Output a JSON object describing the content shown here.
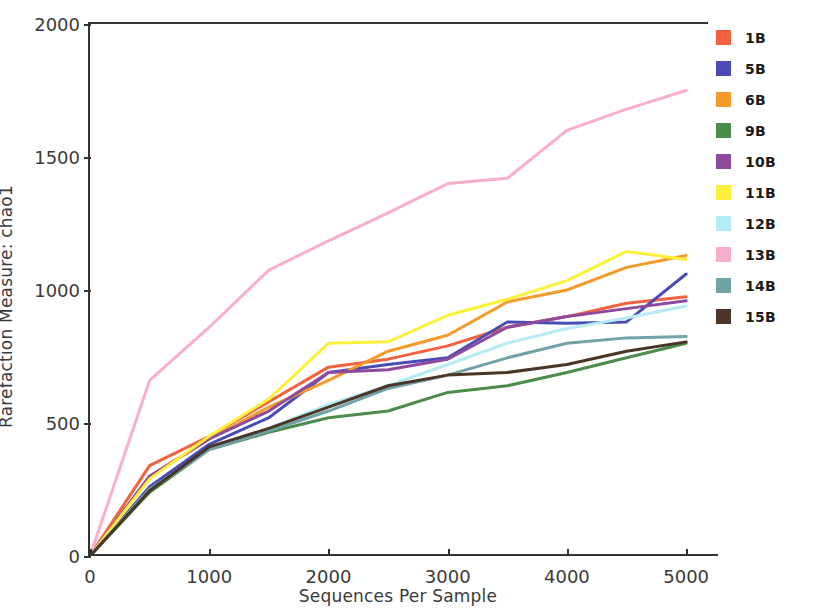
{
  "chart_data": {
    "type": "line",
    "title": "",
    "xlabel": "Sequences Per Sample",
    "ylabel": "Rarefaction Measure: chao1",
    "xlim": [
      0,
      5200
    ],
    "ylim": [
      0,
      2000
    ],
    "xticks": [
      0,
      1000,
      2000,
      3000,
      4000,
      5000
    ],
    "xtick_labels": [
      "0",
      "1000",
      "2000",
      "3000",
      "4000",
      "5000"
    ],
    "yticks": [
      0,
      500,
      1000,
      1500,
      2000
    ],
    "ytick_labels": [
      "0",
      "500",
      "1000",
      "1500",
      "2000"
    ],
    "grid": false,
    "legend_position": "right",
    "x": [
      0,
      500,
      1000,
      1500,
      2000,
      2500,
      3000,
      3500,
      4000,
      4500,
      5000
    ],
    "series": [
      {
        "name": "1B",
        "color": "#f4613e",
        "values": [
          0,
          340,
          450,
          580,
          710,
          740,
          790,
          860,
          900,
          950,
          975
        ]
      },
      {
        "name": "5B",
        "color": "#4b4bb5",
        "values": [
          0,
          260,
          420,
          520,
          690,
          720,
          745,
          880,
          875,
          880,
          1060
        ]
      },
      {
        "name": "6B",
        "color": "#f59a28",
        "values": [
          0,
          300,
          440,
          560,
          660,
          770,
          830,
          955,
          1000,
          1085,
          1130
        ]
      },
      {
        "name": "9B",
        "color": "#4a8c4a",
        "values": [
          0,
          240,
          400,
          465,
          520,
          545,
          615,
          640,
          690,
          745,
          800
        ]
      },
      {
        "name": "10B",
        "color": "#8e4b9e",
        "values": [
          0,
          300,
          440,
          545,
          690,
          700,
          740,
          860,
          900,
          930,
          960
        ]
      },
      {
        "name": "11B",
        "color": "#fdf03a",
        "values": [
          0,
          290,
          450,
          590,
          800,
          805,
          905,
          965,
          1035,
          1145,
          1115
        ]
      },
      {
        "name": "12B",
        "color": "#b5ebf5",
        "values": [
          0,
          250,
          400,
          480,
          570,
          640,
          720,
          800,
          855,
          895,
          940
        ]
      },
      {
        "name": "13B",
        "color": "#f9aecb",
        "values": [
          0,
          660,
          860,
          1075,
          1185,
          1290,
          1400,
          1420,
          1600,
          1680,
          1750
        ]
      },
      {
        "name": "14B",
        "color": "#6fa3a8",
        "values": [
          0,
          250,
          400,
          470,
          545,
          630,
          680,
          745,
          800,
          820,
          825
        ]
      },
      {
        "name": "15B",
        "color": "#4a3526",
        "values": [
          0,
          245,
          410,
          480,
          560,
          640,
          680,
          690,
          720,
          770,
          805
        ]
      }
    ]
  }
}
